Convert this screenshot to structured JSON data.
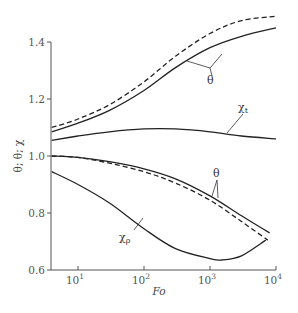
{
  "chart_data": {
    "type": "line",
    "title": "",
    "xlabel": "Fo",
    "ylabel": "θ; θ; χ",
    "xscale": "log",
    "xlim": [
      4,
      10000
    ],
    "ylim": [
      0.6,
      1.5
    ],
    "x_ticks": [
      {
        "value": 10,
        "label": "10",
        "exp": "1"
      },
      {
        "value": 100,
        "label": "10",
        "exp": "2"
      },
      {
        "value": 1000,
        "label": "10",
        "exp": "3"
      },
      {
        "value": 10000,
        "label": "10",
        "exp": "4"
      }
    ],
    "y_ticks": [
      {
        "value": 0.6,
        "label": "0.6"
      },
      {
        "value": 0.8,
        "label": "0.8"
      },
      {
        "value": 1.0,
        "label": "1.0"
      },
      {
        "value": 1.2,
        "label": "1.2"
      },
      {
        "value": 1.4,
        "label": "1.4"
      }
    ],
    "grid": false,
    "legend": "none (inline annotations)",
    "series": [
      {
        "name": "θ (upper, dashed)",
        "style": "dashed",
        "x": [
          4,
          10,
          30,
          100,
          300,
          1000,
          3000,
          10000
        ],
        "y": [
          1.1,
          1.13,
          1.18,
          1.26,
          1.35,
          1.43,
          1.475,
          1.49
        ]
      },
      {
        "name": "θ (upper, solid)",
        "style": "solid",
        "x": [
          4,
          10,
          30,
          100,
          300,
          1000,
          3000,
          10000
        ],
        "y": [
          1.085,
          1.115,
          1.16,
          1.23,
          1.31,
          1.38,
          1.42,
          1.45
        ]
      },
      {
        "name": "χt",
        "style": "solid",
        "x": [
          4,
          10,
          30,
          100,
          300,
          1000,
          3000,
          10000
        ],
        "y": [
          1.055,
          1.07,
          1.085,
          1.095,
          1.095,
          1.085,
          1.07,
          1.06
        ]
      },
      {
        "name": "θ (lower, solid)",
        "style": "solid",
        "x": [
          4,
          10,
          30,
          100,
          300,
          1000,
          3000,
          8000
        ],
        "y": [
          1.0,
          0.995,
          0.98,
          0.955,
          0.92,
          0.86,
          0.79,
          0.73
        ]
      },
      {
        "name": "θ (lower, dashed)",
        "style": "dashed",
        "x": [
          4,
          10,
          30,
          100,
          300,
          1000,
          3000,
          7500
        ],
        "y": [
          1.0,
          0.995,
          0.975,
          0.945,
          0.905,
          0.845,
          0.77,
          0.705
        ]
      },
      {
        "name": "χρ",
        "style": "solid",
        "x": [
          4,
          10,
          30,
          100,
          300,
          1000,
          1500,
          3000,
          7000
        ],
        "y": [
          0.945,
          0.9,
          0.835,
          0.745,
          0.675,
          0.64,
          0.635,
          0.65,
          0.705
        ]
      }
    ],
    "annotations": [
      {
        "text": "θ",
        "target": "upper θ pair",
        "x": 300,
        "y": 1.3
      },
      {
        "text": "χ",
        "sub": "t",
        "target": "χt",
        "x": 2000,
        "y": 1.15
      },
      {
        "text": "θ",
        "target": "lower θ pair",
        "x": 1200,
        "y": 0.97
      },
      {
        "text": "χ",
        "sub": "ρ",
        "target": "χρ",
        "x": 30,
        "y": 0.75
      }
    ]
  }
}
